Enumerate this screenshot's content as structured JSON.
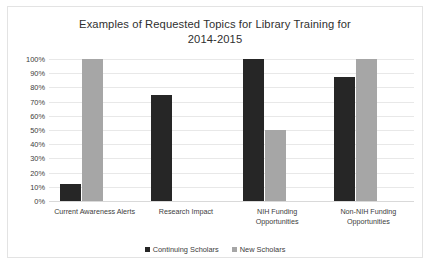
{
  "chart_data": {
    "type": "bar",
    "title": "Examples of Requested Topics for Library Training for 2014-2015",
    "title_lines": [
      "Examples of Requested Topics for Library Training for",
      "2014-2015"
    ],
    "categories": [
      "Current Awareness Alerts",
      "Research Impact",
      "NIH Funding Opportunities",
      "Non-NIH Funding Opportunities"
    ],
    "category_lines": [
      [
        "Current Awareness Alerts"
      ],
      [
        "Research Impact"
      ],
      [
        "NIH Funding",
        "Opportunities"
      ],
      [
        "Non-NIH Funding",
        "Opportunities"
      ]
    ],
    "series": [
      {
        "name": "Continuing Scholars",
        "color": "#262626",
        "values": [
          12,
          75,
          100,
          87
        ]
      },
      {
        "name": "New Scholars",
        "color": "#a6a6a6",
        "values": [
          100,
          0,
          50,
          100
        ]
      }
    ],
    "xlabel": "",
    "ylabel": "",
    "ylim": [
      0,
      100
    ],
    "ytick_labels": [
      "100%",
      "90%",
      "80%",
      "70%",
      "60%",
      "50%",
      "40%",
      "30%",
      "20%",
      "10%",
      "0%"
    ],
    "ytick_values": [
      100,
      90,
      80,
      70,
      60,
      50,
      40,
      30,
      20,
      10,
      0
    ],
    "grid": true,
    "legend_position": "bottom"
  },
  "legend": {
    "items": [
      {
        "label": "Continuing Scholars",
        "color": "#262626"
      },
      {
        "label": "New Scholars",
        "color": "#a6a6a6"
      }
    ]
  },
  "colors": {
    "continuing_scholars": "#262626",
    "new_scholars": "#a6a6a6",
    "gridline": "#e8e8e8",
    "border": "#e3e3e3",
    "text": "#3d3d3d"
  }
}
